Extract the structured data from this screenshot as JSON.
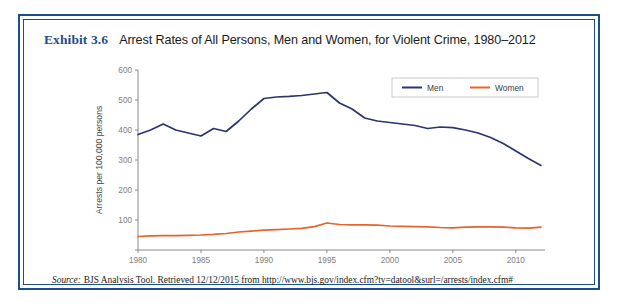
{
  "exhibit": {
    "number": "Exhibit 3.6",
    "title": "Arrest Rates of All Persons, Men and Women, for Violent Crime, 1980–2012"
  },
  "source": {
    "label": "Source:",
    "text": "BJS Analysis Tool. Retrieved 12/12/2015 from http://www.bjs.gov/index.cfm?ty=datool&surl=/arrests/index.cfm#"
  },
  "colors": {
    "frame": "#1f4e8c",
    "men": "#2b3470",
    "women": "#e8622a",
    "axis": "#8a8a8a",
    "tick_label": "#7d7d7d",
    "background": "#ffffff"
  },
  "legend": {
    "position": "top-right",
    "entries": [
      {
        "label": "Men",
        "color": "#2b3470"
      },
      {
        "label": "Women",
        "color": "#e8622a"
      }
    ]
  },
  "chart_data": {
    "type": "line",
    "title": "Arrest Rates of All Persons, Men and Women, for Violent Crime, 1980–2012",
    "xlabel": "",
    "ylabel": "Arrests per 100,000 persons",
    "xlim": [
      1980,
      2012
    ],
    "ylim": [
      0,
      600
    ],
    "ytick_values": [
      0,
      100,
      200,
      300,
      400,
      500,
      600
    ],
    "ytick_labels": [
      "",
      "100",
      "200",
      "300",
      "400",
      "500",
      "600"
    ],
    "xtick_values": [
      1980,
      1985,
      1990,
      1995,
      2000,
      2005,
      2010
    ],
    "xtick_labels": [
      "1980",
      "1985",
      "1990",
      "1995",
      "2000",
      "2005",
      "2010"
    ],
    "grid": false,
    "x": [
      1980,
      1981,
      1982,
      1983,
      1984,
      1985,
      1986,
      1987,
      1988,
      1989,
      1990,
      1991,
      1992,
      1993,
      1994,
      1995,
      1996,
      1997,
      1998,
      1999,
      2000,
      2001,
      2002,
      2003,
      2004,
      2005,
      2006,
      2007,
      2008,
      2009,
      2010,
      2011,
      2012
    ],
    "series": [
      {
        "name": "Men",
        "color": "#2b3470",
        "values": [
          385,
          400,
          420,
          400,
          390,
          380,
          405,
          395,
          430,
          470,
          505,
          510,
          512,
          515,
          520,
          525,
          490,
          470,
          440,
          430,
          425,
          420,
          415,
          405,
          410,
          408,
          400,
          390,
          375,
          355,
          330,
          305,
          282
        ]
      },
      {
        "name": "Women",
        "color": "#e8622a",
        "values": [
          45,
          47,
          48,
          48,
          49,
          50,
          52,
          55,
          60,
          63,
          66,
          68,
          70,
          72,
          78,
          90,
          85,
          84,
          84,
          83,
          80,
          79,
          78,
          77,
          75,
          74,
          76,
          77,
          77,
          76,
          74,
          73,
          76
        ]
      }
    ]
  }
}
